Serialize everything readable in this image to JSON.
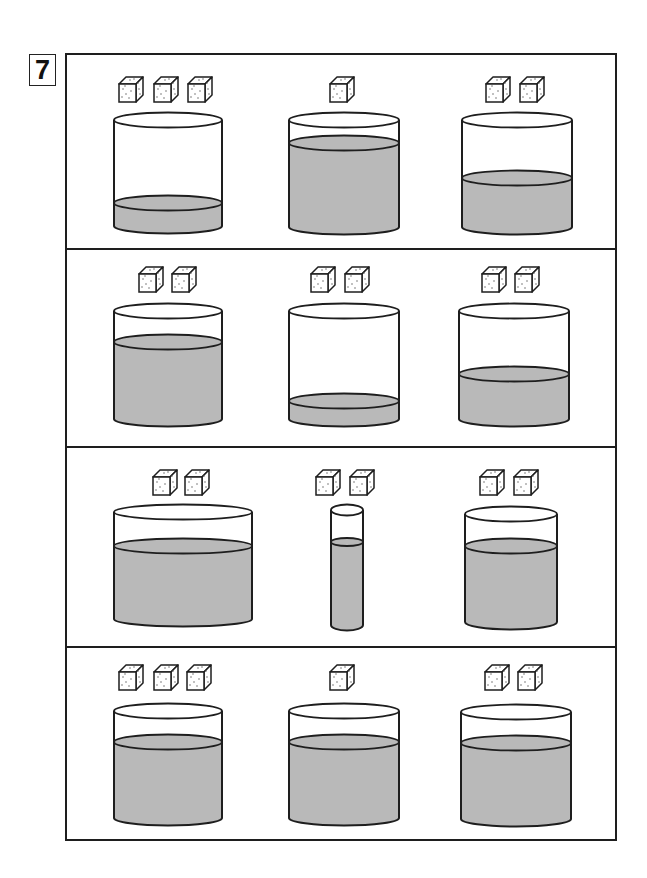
{
  "question_number": "7",
  "colors": {
    "background": "#ffffff",
    "stroke": "#1e1e1e",
    "water": "#b9b9b9",
    "cube_fill": "#ffffff",
    "cube_dots": "#555555"
  },
  "frame": {
    "x": 66,
    "y": 54,
    "width": 550,
    "height": 786,
    "dividers_y": [
      249,
      447,
      647
    ]
  },
  "cube_size": {
    "width": 24,
    "height": 25
  },
  "rows": [
    {
      "cube_y": 77,
      "cells": [
        {
          "sugar_cubes": 3,
          "cube_x": [
            119,
            154,
            188
          ],
          "container": {
            "type": "glass",
            "cx": 168,
            "rx": 54,
            "ry": 7.5,
            "top": 120,
            "bottom": 226,
            "water": 203,
            "water_ry": 7.5
          }
        },
        {
          "sugar_cubes": 1,
          "cube_x": [
            330
          ],
          "container": {
            "type": "glass",
            "cx": 344,
            "rx": 55,
            "ry": 7.5,
            "top": 120,
            "bottom": 227,
            "water": 143,
            "water_ry": 7.5
          }
        },
        {
          "sugar_cubes": 2,
          "cube_x": [
            486,
            520
          ],
          "container": {
            "type": "glass",
            "cx": 517,
            "rx": 55,
            "ry": 7.5,
            "top": 120,
            "bottom": 227,
            "water": 178,
            "water_ry": 7.5
          }
        }
      ]
    },
    {
      "cube_y": 267,
      "cells": [
        {
          "sugar_cubes": 2,
          "cube_x": [
            139,
            172
          ],
          "container": {
            "type": "glass",
            "cx": 168,
            "rx": 54,
            "ry": 7.5,
            "top": 311,
            "bottom": 419,
            "water": 342,
            "water_ry": 7.5
          }
        },
        {
          "sugar_cubes": 2,
          "cube_x": [
            311,
            345
          ],
          "container": {
            "type": "glass",
            "cx": 344,
            "rx": 55,
            "ry": 7.5,
            "top": 311,
            "bottom": 419,
            "water": 401,
            "water_ry": 7.5
          }
        },
        {
          "sugar_cubes": 2,
          "cube_x": [
            482,
            515
          ],
          "container": {
            "type": "glass",
            "cx": 514,
            "rx": 55,
            "ry": 7.5,
            "top": 311,
            "bottom": 419,
            "water": 374,
            "water_ry": 7.5
          }
        }
      ]
    },
    {
      "cube_y": 470,
      "cells": [
        {
          "sugar_cubes": 2,
          "cube_x": [
            153,
            185
          ],
          "container": {
            "type": "wide-glass",
            "cx": 183,
            "rx": 69,
            "ry": 7.5,
            "top": 512,
            "bottom": 619,
            "water": 546,
            "water_ry": 7.5
          }
        },
        {
          "sugar_cubes": 2,
          "cube_x": [
            316,
            350
          ],
          "container": {
            "type": "test-tube",
            "cx": 347,
            "rx": 16,
            "ry": 5.5,
            "top": 510,
            "bottom": 625,
            "water": 542,
            "water_ry": 4
          }
        },
        {
          "sugar_cubes": 2,
          "cube_x": [
            480,
            514
          ],
          "container": {
            "type": "narrow-glass",
            "cx": 511,
            "rx": 46,
            "ry": 7.5,
            "top": 514,
            "bottom": 622,
            "water": 546,
            "water_ry": 7.5
          }
        }
      ]
    },
    {
      "cube_y": 665,
      "cells": [
        {
          "sugar_cubes": 3,
          "cube_x": [
            119,
            154,
            187
          ],
          "container": {
            "type": "glass",
            "cx": 168,
            "rx": 54,
            "ry": 7.5,
            "top": 711,
            "bottom": 818,
            "water": 742,
            "water_ry": 7.5
          }
        },
        {
          "sugar_cubes": 1,
          "cube_x": [
            330
          ],
          "container": {
            "type": "glass",
            "cx": 344,
            "rx": 55,
            "ry": 7.5,
            "top": 711,
            "bottom": 818,
            "water": 742,
            "water_ry": 7.5
          }
        },
        {
          "sugar_cubes": 2,
          "cube_x": [
            485,
            518
          ],
          "container": {
            "type": "glass",
            "cx": 516,
            "rx": 55,
            "ry": 7.5,
            "top": 712,
            "bottom": 819,
            "water": 743,
            "water_ry": 7.5
          }
        }
      ]
    }
  ]
}
